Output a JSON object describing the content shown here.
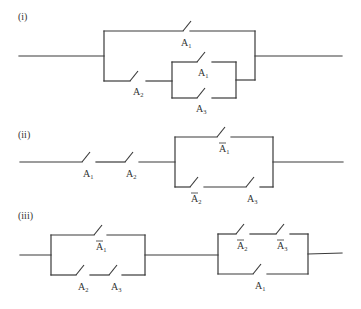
{
  "figure": {
    "circuits": [
      {
        "id": "i",
        "caption": "(i)",
        "caption_pos": [
          18,
          20
        ],
        "wires": [
          [
            [
              19,
              56
            ],
            [
              104,
              56
            ]
          ],
          [
            [
              104,
              31
            ],
            [
              104,
              81
            ]
          ],
          [
            [
              104,
              31
            ],
            [
              183,
              31
            ]
          ],
          [
            [
              190,
              31
            ],
            [
              255,
              31
            ]
          ],
          [
            [
              104,
              81
            ],
            [
              130,
              81
            ]
          ],
          [
            [
              146,
              81
            ],
            [
              172,
              81
            ]
          ],
          [
            [
              172,
              62
            ],
            [
              172,
              98
            ]
          ],
          [
            [
              172,
              62
            ],
            [
              197,
              62
            ]
          ],
          [
            [
              212,
              62
            ],
            [
              236,
              62
            ]
          ],
          [
            [
              172,
              98
            ],
            [
              197,
              98
            ]
          ],
          [
            [
              212,
              98
            ],
            [
              236,
              98
            ]
          ],
          [
            [
              236,
              62
            ],
            [
              236,
              98
            ]
          ],
          [
            [
              236,
              80
            ],
            [
              255,
              80
            ]
          ],
          [
            [
              255,
              31
            ],
            [
              255,
              80
            ]
          ],
          [
            [
              255,
              56
            ],
            [
              342,
              56
            ]
          ]
        ],
        "switches": [
          {
            "x": 183,
            "y": 31,
            "label": "A",
            "sub": "1",
            "bar": false,
            "lx": 181,
            "ly": 46
          },
          {
            "x": 130,
            "y": 81,
            "label": "A",
            "sub": "2",
            "bar": false,
            "lx": 133,
            "ly": 95
          },
          {
            "x": 197,
            "y": 62,
            "label": "A",
            "sub": "1",
            "bar": false,
            "lx": 198,
            "ly": 76
          },
          {
            "x": 197,
            "y": 98,
            "label": "A",
            "sub": "3",
            "bar": false,
            "lx": 196,
            "ly": 112
          }
        ]
      },
      {
        "id": "ii",
        "caption": "(ii)",
        "caption_pos": [
          18,
          138
        ],
        "wires": [
          [
            [
              20,
              162
            ],
            [
              82,
              162
            ]
          ],
          [
            [
              96,
              162
            ],
            [
              125,
              162
            ]
          ],
          [
            [
              139,
              162
            ],
            [
              175,
              162
            ]
          ],
          [
            [
              175,
              137
            ],
            [
              175,
              187
            ]
          ],
          [
            [
              175,
              137
            ],
            [
              217,
              137
            ]
          ],
          [
            [
              231,
              137
            ],
            [
              273,
              137
            ]
          ],
          [
            [
              175,
              187
            ],
            [
              190,
              187
            ]
          ],
          [
            [
              204,
              187
            ],
            [
              246,
              187
            ]
          ],
          [
            [
              260,
              187
            ],
            [
              273,
              187
            ]
          ],
          [
            [
              273,
              137
            ],
            [
              273,
              187
            ]
          ],
          [
            [
              273,
              162
            ],
            [
              343,
              162
            ]
          ]
        ],
        "switches": [
          {
            "x": 82,
            "y": 162,
            "label": "A",
            "sub": "1",
            "bar": false,
            "lx": 83,
            "ly": 177
          },
          {
            "x": 125,
            "y": 162,
            "label": "A",
            "sub": "2",
            "bar": false,
            "lx": 126,
            "ly": 177
          },
          {
            "x": 217,
            "y": 137,
            "label": "A",
            "sub": "1",
            "bar": true,
            "lx": 219,
            "ly": 152
          },
          {
            "x": 190,
            "y": 187,
            "label": "A",
            "sub": "2",
            "bar": true,
            "lx": 191,
            "ly": 202
          },
          {
            "x": 246,
            "y": 187,
            "label": "A",
            "sub": "3",
            "bar": false,
            "lx": 247,
            "ly": 202
          }
        ]
      },
      {
        "id": "iii",
        "caption": "(iii)",
        "caption_pos": [
          18,
          219
        ],
        "wires": [
          [
            [
              20,
              255
            ],
            [
              51,
              255
            ]
          ],
          [
            [
              51,
              235
            ],
            [
              51,
              275
            ]
          ],
          [
            [
              51,
              235
            ],
            [
              94,
              235
            ]
          ],
          [
            [
              107,
              235
            ],
            [
              145,
              235
            ]
          ],
          [
            [
              51,
              275
            ],
            [
              76,
              275
            ]
          ],
          [
            [
              90,
              275
            ],
            [
              109,
              275
            ]
          ],
          [
            [
              122,
              275
            ],
            [
              145,
              275
            ]
          ],
          [
            [
              145,
              235
            ],
            [
              145,
              275
            ]
          ],
          [
            [
              145,
              255
            ],
            [
              218,
              255
            ]
          ],
          [
            [
              218,
              234
            ],
            [
              218,
              274
            ]
          ],
          [
            [
              218,
              234
            ],
            [
              236,
              234
            ]
          ],
          [
            [
              250,
              234
            ],
            [
              276,
              234
            ]
          ],
          [
            [
              290,
              234
            ],
            [
              308,
              234
            ]
          ],
          [
            [
              218,
              274
            ],
            [
              253,
              274
            ]
          ],
          [
            [
              267,
              274
            ],
            [
              308,
              274
            ]
          ],
          [
            [
              308,
              234
            ],
            [
              308,
              274
            ]
          ],
          [
            [
              308,
              254
            ],
            [
              342,
              253
            ]
          ]
        ],
        "switches": [
          {
            "x": 94,
            "y": 235,
            "label": "A",
            "sub": "1",
            "bar": true,
            "lx": 96,
            "ly": 250
          },
          {
            "x": 76,
            "y": 275,
            "label": "A",
            "sub": "2",
            "bar": false,
            "lx": 78,
            "ly": 290
          },
          {
            "x": 109,
            "y": 275,
            "label": "A",
            "sub": "3",
            "bar": false,
            "lx": 111,
            "ly": 290
          },
          {
            "x": 236,
            "y": 234,
            "label": "A",
            "sub": "2",
            "bar": true,
            "lx": 237,
            "ly": 249
          },
          {
            "x": 276,
            "y": 234,
            "label": "A",
            "sub": "3",
            "bar": true,
            "lx": 277,
            "ly": 249
          },
          {
            "x": 253,
            "y": 274,
            "label": "A",
            "sub": "1",
            "bar": false,
            "lx": 255,
            "ly": 289
          }
        ]
      }
    ]
  }
}
